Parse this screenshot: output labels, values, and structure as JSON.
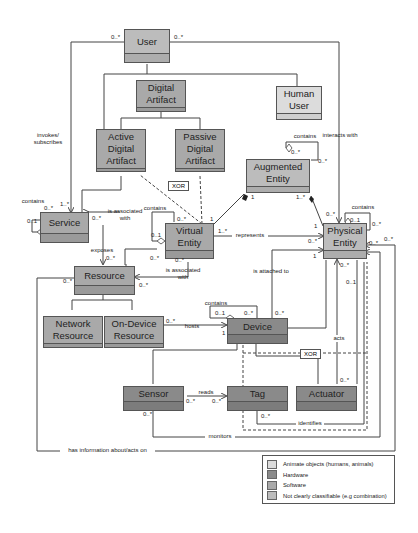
{
  "diagram": {
    "type": "UML class diagram",
    "classes": {
      "user": {
        "label": "User",
        "category": "mixed"
      },
      "digital_artifact": {
        "label": "Digital\nArtifact",
        "category": "software"
      },
      "human_user": {
        "label": "Human\nUser",
        "category": "animate"
      },
      "active_digital_artifact": {
        "label": "Active\nDigital\nArtifact",
        "category": "software"
      },
      "passive_digital_artifact": {
        "label": "Passive\nDigital\nArtifact",
        "category": "software"
      },
      "augmented_entity": {
        "label": "Augmented\nEntity",
        "category": "mixed"
      },
      "service": {
        "label": "Service",
        "category": "software"
      },
      "virtual_entity": {
        "label": "Virtual\nEntity",
        "category": "software"
      },
      "physical_entity": {
        "label": "Physical\nEntity",
        "category": "mixed"
      },
      "resource": {
        "label": "Resource",
        "category": "software"
      },
      "network_resource": {
        "label": "Network\nResource",
        "category": "software"
      },
      "on_device_resource": {
        "label": "On-Device\nResource",
        "category": "software"
      },
      "device": {
        "label": "Device",
        "category": "hardware"
      },
      "sensor": {
        "label": "Sensor",
        "category": "hardware"
      },
      "tag": {
        "label": "Tag",
        "category": "hardware"
      },
      "actuator": {
        "label": "Actuator",
        "category": "hardware"
      }
    },
    "association_labels": {
      "invokes": "invokes/\nsubscribes",
      "interacts_with": "interacts with",
      "contains_augmented": "contains",
      "contains_service": "contains",
      "contains_virtual": "contains",
      "contains_physical": "contains",
      "contains_device": "contains",
      "service_virtual": "is associated\nwith",
      "resource_virtual": "is associated\nwith",
      "exposes": "exposes",
      "represents": "represents",
      "is_attached_to": "is attached to",
      "hosts": "hosts",
      "acts": "acts",
      "reads": "reads",
      "identifies": "identifies",
      "monitors": "monitors",
      "has_information": "has information about/acts on"
    },
    "constraints": {
      "xor_artifact": "XOR",
      "xor_device": "XOR"
    },
    "multiplicities": {
      "user_left": "0..*",
      "user_right": "0..*",
      "service_invokes": "1..*",
      "service_contains_a": "0..*",
      "service_contains_b": "0..1",
      "service_assoc": "0..*",
      "augmented_contains_a": "0..*",
      "augmented_contains_b": "0..*",
      "augmented_left": "1",
      "augmented_right": "1..*",
      "virtual_top": "0..*",
      "virtual_top_right": "1",
      "virtual_contains": "0..1",
      "virtual_represents": "1..*",
      "virtual_bottom_left": "0..*",
      "virtual_bottom": "0..*",
      "physical_top_left": "0..*",
      "physical_contains": "0..1",
      "physical_contains_b": "0..*",
      "physical_left_top": "1",
      "physical_represents": "0..*",
      "physical_right_a": "0..*",
      "physical_right_b": "0..*",
      "physical_attached": "1",
      "physical_below_a": "0..*",
      "physical_below_b": "0..1",
      "resource_exposes": "0..*",
      "resource_left": "0..*",
      "resource_right": "0..*",
      "on_device_hosts": "0..*",
      "device_contains_a": "0..1",
      "device_contains_b": "0..*",
      "device_attached": "0..*",
      "device_hosts": "1",
      "sensor_reads": "0..*",
      "sensor_bottom": "0..*",
      "tag_reads": "0..*",
      "tag_identifies": "0..*",
      "actuator_top": "0..*"
    }
  },
  "legend": {
    "items": [
      {
        "label": "Animate objects (humans, animals)",
        "color": "#dcdcdc"
      },
      {
        "label": "Hardware",
        "color": "#8a8a8a"
      },
      {
        "label": "Software",
        "color": "#a9a9a9"
      },
      {
        "label": "Not clearly classifiable (e.g combination)",
        "color": "#bcbcbc"
      }
    ]
  }
}
